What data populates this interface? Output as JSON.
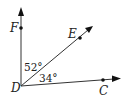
{
  "diagram": {
    "type": "angle-figure",
    "vertex": {
      "label": "D"
    },
    "rays": [
      {
        "point": "F",
        "direction": "vertical"
      },
      {
        "point": "E",
        "direction": "diagonal"
      },
      {
        "point": "C",
        "direction": "near-horizontal"
      }
    ],
    "points": {
      "F": "F",
      "E": "E",
      "C": "C",
      "D": "D"
    },
    "angles": [
      {
        "between": "FDE",
        "label": "52°"
      },
      {
        "between": "EDC",
        "label": "34°"
      }
    ]
  }
}
